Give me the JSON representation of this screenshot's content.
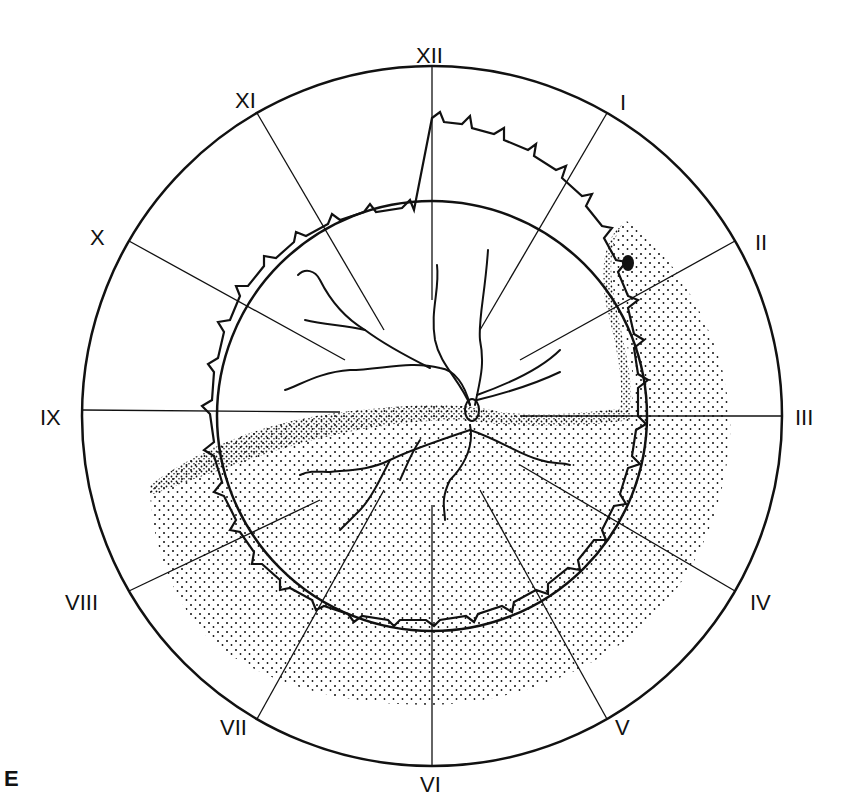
{
  "figure": {
    "panel_letter": "E",
    "clock_labels": [
      "XII",
      "I",
      "II",
      "III",
      "IV",
      "V",
      "VI",
      "VII",
      "VIII",
      "IX",
      "X",
      "XI"
    ],
    "colors": {
      "ink": "#111111",
      "background": "#ffffff"
    }
  }
}
